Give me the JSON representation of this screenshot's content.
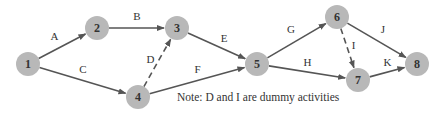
{
  "nodes": [
    {
      "id": "1",
      "label": "1"
    },
    {
      "id": "2",
      "label": "2"
    },
    {
      "id": "3",
      "label": "3"
    },
    {
      "id": "4",
      "label": "4"
    },
    {
      "id": "5",
      "label": "5"
    },
    {
      "id": "6",
      "label": "6"
    },
    {
      "id": "7",
      "label": "7"
    },
    {
      "id": "8",
      "label": "8"
    }
  ],
  "edges": [
    {
      "from": "1",
      "to": "2",
      "label": "A",
      "dummy": false
    },
    {
      "from": "2",
      "to": "3",
      "label": "B",
      "dummy": false
    },
    {
      "from": "1",
      "to": "4",
      "label": "C",
      "dummy": false
    },
    {
      "from": "4",
      "to": "3",
      "label": "D",
      "dummy": true
    },
    {
      "from": "3",
      "to": "5",
      "label": "E",
      "dummy": false
    },
    {
      "from": "4",
      "to": "5",
      "label": "F",
      "dummy": false
    },
    {
      "from": "5",
      "to": "6",
      "label": "G",
      "dummy": false
    },
    {
      "from": "5",
      "to": "7",
      "label": "H",
      "dummy": false
    },
    {
      "from": "6",
      "to": "7",
      "label": "I",
      "dummy": true
    },
    {
      "from": "6",
      "to": "8",
      "label": "J",
      "dummy": false
    },
    {
      "from": "7",
      "to": "8",
      "label": "K",
      "dummy": false
    }
  ],
  "note": "Note:  D and I are dummy activities",
  "colors": {
    "node_fill": "#b8b8b8",
    "edge": "#555555"
  }
}
